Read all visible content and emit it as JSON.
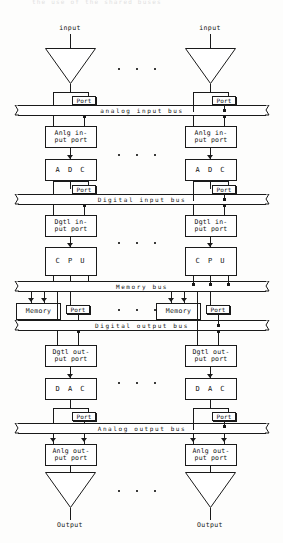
{
  "caption": {
    "top_line": "the use of the shared buses"
  },
  "diagram": {
    "ink_color": "#1a1a1a",
    "background_color": "#fdfdfc",
    "channel_count_shown": 2,
    "repetition_indicator": "...",
    "buses": [
      {
        "id": "analog-input-bus",
        "label": "analog  input  bus"
      },
      {
        "id": "digital-input-bus",
        "label": "Digital  input  bus"
      },
      {
        "id": "memory-bus",
        "label": "Memory  bus"
      },
      {
        "id": "digital-output-bus",
        "label": "Digital  output  bus"
      },
      {
        "id": "analog-output-bus",
        "label": "Analog  output  bus"
      }
    ],
    "labels": {
      "input": "input",
      "output": "Output",
      "port": "Port",
      "anlg_input_port": "Anlg in-\nput port",
      "adc": "A D C",
      "dgtl_input_port": "Dgtl in-\nput port",
      "cpu": "C P U",
      "memory": "Memory",
      "dgtl_output_port": "Dgtl out-\nput port",
      "dac": "D A C",
      "anlg_output_port": "Anlg out-\nput port"
    },
    "channels": [
      {
        "id": "channel-left",
        "input_label": "input",
        "output_label": "Output",
        "blocks": [
          "Port",
          "Anlg in-\nput port",
          "A D C",
          "Port",
          "Dgtl in-\nput port",
          "C P U",
          "Memory",
          "Port",
          "Dgtl out-\nput port",
          "D A C",
          "Port",
          "Anlg out-\nput port"
        ]
      },
      {
        "id": "channel-right",
        "input_label": "input",
        "output_label": "Output",
        "blocks": [
          "Port",
          "Anlg in-\nput port",
          "A D C",
          "Port",
          "Dgtl in-\nput port",
          "C P U",
          "Memory",
          "Port",
          "Dgtl out-\nput port",
          "D A C",
          "Port",
          "Anlg out-\nput port"
        ]
      }
    ]
  }
}
